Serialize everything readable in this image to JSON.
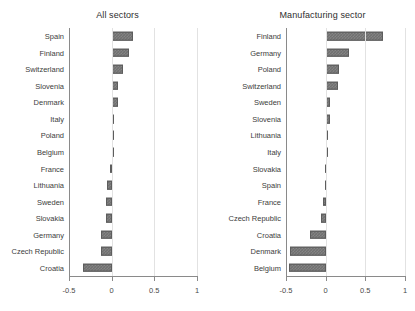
{
  "chart_data": [
    {
      "type": "bar",
      "orientation": "horizontal",
      "title": "All sectors",
      "xlabel": "",
      "ylabel": "",
      "xlim": [
        -0.5,
        1.0
      ],
      "xticks": [
        -0.5,
        0,
        0.5,
        1
      ],
      "xticklabels": [
        "-0.5",
        "0",
        "0.5",
        "1"
      ],
      "grid": true,
      "legend": "none",
      "categories": [
        "Spain",
        "Finland",
        "Switzerland",
        "Slovenia",
        "Denmark",
        "Italy",
        "Poland",
        "Belgium",
        "France",
        "Lithuania",
        "Sweden",
        "Slovakia",
        "Germany",
        "Czech Republic",
        "Croatia"
      ],
      "values": [
        0.25,
        0.2,
        0.13,
        0.07,
        0.07,
        0.03,
        0.01,
        0.0,
        -0.02,
        -0.06,
        -0.07,
        -0.07,
        -0.12,
        -0.13,
        -0.34
      ]
    },
    {
      "type": "bar",
      "orientation": "horizontal",
      "title": "Manufacturing sector",
      "xlabel": "",
      "ylabel": "",
      "xlim": [
        -0.5,
        1.0
      ],
      "xticks": [
        -0.5,
        0,
        0.5,
        1
      ],
      "xticklabels": [
        "-0.5",
        "0",
        "0.5",
        "1"
      ],
      "grid": true,
      "legend": "none",
      "categories": [
        "Finland",
        "Germany",
        "Poland",
        "Switzerland",
        "Sweden",
        "Slovenia",
        "Lithuania",
        "Italy",
        "Slovakia",
        "Spain",
        "France",
        "Czech Republic",
        "Croatia",
        "Denmark",
        "Belgium"
      ],
      "values": [
        0.72,
        0.3,
        0.17,
        0.15,
        0.05,
        0.06,
        0.02,
        0.01,
        -0.01,
        -0.01,
        -0.03,
        -0.06,
        -0.2,
        -0.45,
        -0.46
      ]
    }
  ]
}
